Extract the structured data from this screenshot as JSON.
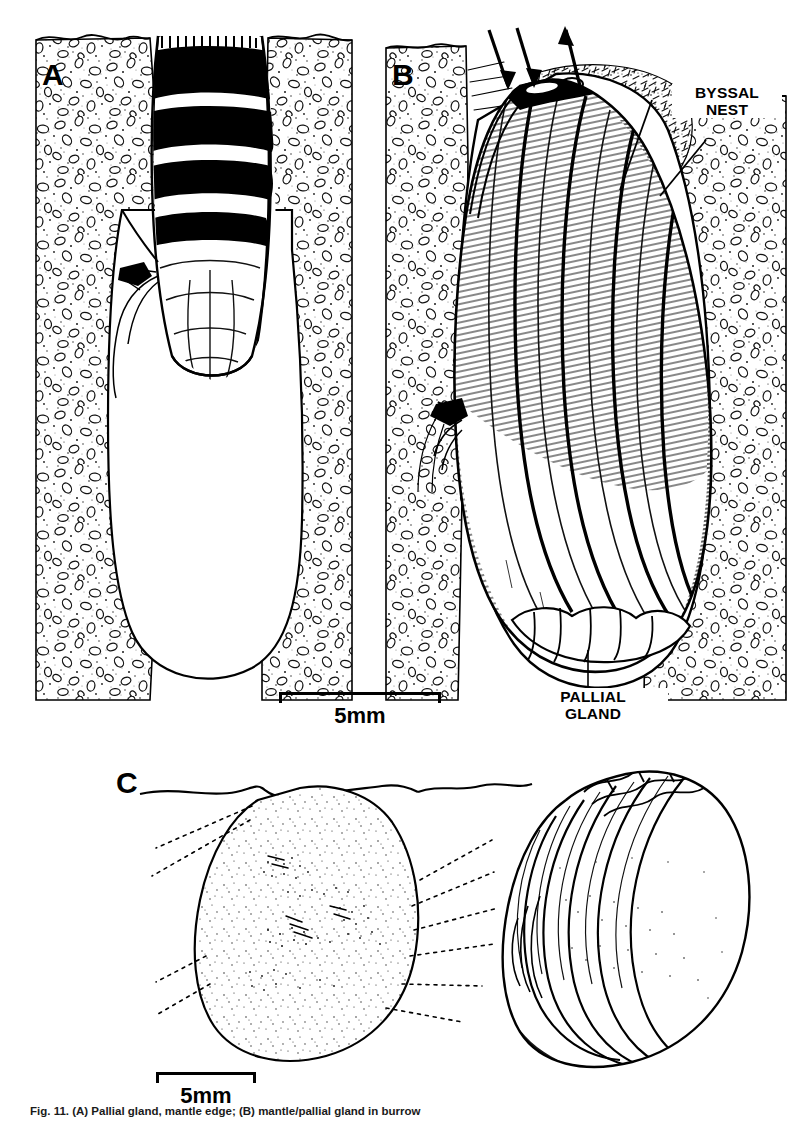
{
  "figure": {
    "panels": [
      {
        "id": "A",
        "label": "A",
        "description": "Mussel in burrow viewed from above, sediment cut-away with empty burrow cavity below"
      },
      {
        "id": "B",
        "label": "B",
        "description": "Mussel in burrow in lateral view showing byssal nest, inhalant and exhalant currents, and pallial gland"
      },
      {
        "id": "C",
        "label": "C",
        "description": "Isolated pallial gland outline at left and external view of right valve at right"
      }
    ],
    "callouts": [
      {
        "name": "byssal-nest",
        "text": "BYSSAL\nNEST"
      },
      {
        "name": "pallial-gland",
        "text": "PALLIAL\nGLAND"
      }
    ],
    "scale_bars": [
      {
        "name": "scale-bar-ab",
        "label": "5mm",
        "length_px": 162
      },
      {
        "name": "scale-bar-c",
        "label": "5mm",
        "length_px": 100
      }
    ],
    "arrows": [
      {
        "name": "inhalant-arrow-1",
        "direction": "down-right",
        "meaning": "inhalant current"
      },
      {
        "name": "inhalant-arrow-2",
        "direction": "down-right",
        "meaning": "inhalant current"
      },
      {
        "name": "exhalant-arrow",
        "direction": "up-right",
        "meaning": "exhalant current"
      }
    ],
    "colors": {
      "ink": "#000000",
      "paper": "#ffffff",
      "sediment_stipple": "#3a3a3a",
      "shade": "#8a8a8a"
    }
  },
  "caption": {
    "number": "Fig. 11.",
    "text": "(A) Pallial gland, mantle edge; (B) mantle/pallial gland in burrow"
  }
}
